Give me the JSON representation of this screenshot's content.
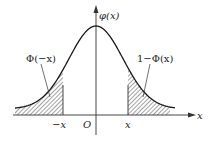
{
  "diagram": {
    "labels": {
      "y_axis": "φ(x)",
      "x_axis": "x",
      "origin": "O",
      "neg_x": "−x",
      "pos_x": "x",
      "left_area": "Φ(−x)",
      "right_area": "1−Φ(x)"
    },
    "colors": {
      "curve": "#1a1a1a",
      "axes": "#333333",
      "hatch": "#333333",
      "background": "#ffffff"
    }
  }
}
